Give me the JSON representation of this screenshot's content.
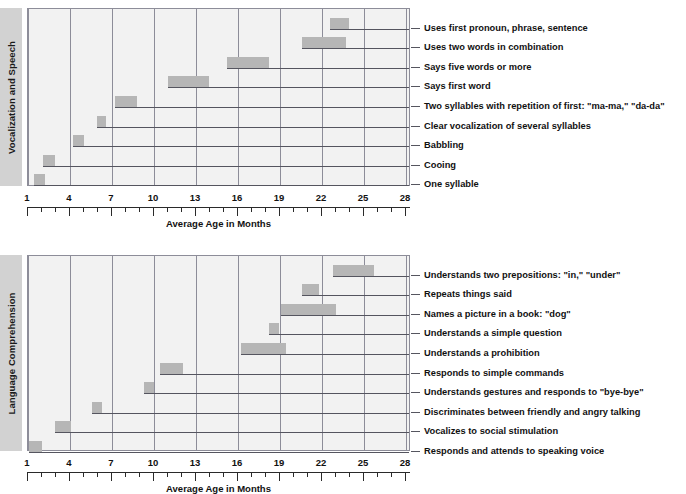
{
  "figure": {
    "axis_title": "Average Age in Months",
    "axis_ticks": [
      1,
      4,
      7,
      10,
      13,
      16,
      19,
      22,
      25,
      28
    ],
    "axis_min": 1,
    "axis_max": 28,
    "bar_color": "#b6b6b6",
    "plot_background": "#f2f2f2",
    "grid_color": "#8d8d99",
    "sidebar_background": "#d2d2d2"
  },
  "panels": [
    {
      "id": "vocal",
      "title": "Vocalization and Speech",
      "axis_title": "Average Age in Months",
      "rows": [
        {
          "label": "Uses first pronoun, phrase, sentence",
          "start": 22.6,
          "end": 23.9
        },
        {
          "label": "Uses two words in combination",
          "start": 20.6,
          "end": 23.7
        },
        {
          "label": "Says five words or more",
          "start": 15.2,
          "end": 18.2
        },
        {
          "label": "Says first word",
          "start": 11.0,
          "end": 13.9
        },
        {
          "label": "Two syllables with repetition of first: \"ma-ma,\" \"da-da\"",
          "start": 7.2,
          "end": 8.8
        },
        {
          "label": "Clear vocalization of several syllables",
          "start": 5.9,
          "end": 6.6
        },
        {
          "label": "Babbling",
          "start": 4.2,
          "end": 5.0
        },
        {
          "label": "Cooing",
          "start": 2.1,
          "end": 2.9
        },
        {
          "label": "One syllable",
          "start": 1.4,
          "end": 2.2
        }
      ]
    },
    {
      "id": "lang",
      "title": "Language Comprehension",
      "axis_title": "Average Age in Months",
      "rows": [
        {
          "label": "Understands two prepositions: \"in,\" \"under\"",
          "start": 22.8,
          "end": 25.7
        },
        {
          "label": "Repeats things said",
          "start": 20.6,
          "end": 21.8
        },
        {
          "label": "Names a picture in a book: \"dog\"",
          "start": 19.1,
          "end": 23.0
        },
        {
          "label": "Understands a simple question",
          "start": 18.2,
          "end": 18.9
        },
        {
          "label": "Understands a prohibition",
          "start": 16.2,
          "end": 19.4
        },
        {
          "label": "Responds to simple commands",
          "start": 10.4,
          "end": 12.1
        },
        {
          "label": "Understands gestures and responds to \"bye-bye\"",
          "start": 9.3,
          "end": 10.0
        },
        {
          "label": "Discriminates between friendly and angry talking",
          "start": 5.6,
          "end": 6.3
        },
        {
          "label": "Vocalizes to social stimulation",
          "start": 2.9,
          "end": 4.1
        },
        {
          "label": "Responds and attends to speaking voice",
          "start": 1.1,
          "end": 2.0
        }
      ]
    }
  ],
  "chart_data": {
    "type": "bar",
    "xlabel": "Average Age in Months",
    "ylabel": "",
    "xlim": [
      1,
      28
    ],
    "grid": true,
    "legend": "none",
    "orientation": "horizontal-range",
    "note": "Each row is a floating (range) bar spanning the typical age window for a milestone; a leader line runs from the bar to its label on the right.",
    "panels": [
      {
        "name": "Vocalization and Speech",
        "categories": [
          "Uses first pronoun, phrase, sentence",
          "Uses two words in combination",
          "Says five words or more",
          "Says first word",
          "Two syllables with repetition of first: \"ma-ma,\" \"da-da\"",
          "Clear vocalization of several syllables",
          "Babbling",
          "Cooing",
          "One syllable"
        ],
        "ranges": [
          [
            22.6,
            23.9
          ],
          [
            20.6,
            23.7
          ],
          [
            15.2,
            18.2
          ],
          [
            11.0,
            13.9
          ],
          [
            7.2,
            8.8
          ],
          [
            5.9,
            6.6
          ],
          [
            4.2,
            5.0
          ],
          [
            2.1,
            2.9
          ],
          [
            1.4,
            2.2
          ]
        ]
      },
      {
        "name": "Language Comprehension",
        "categories": [
          "Understands two prepositions: \"in,\" \"under\"",
          "Repeats things said",
          "Names a picture in a book: \"dog\"",
          "Understands a simple question",
          "Understands a prohibition",
          "Responds to simple commands",
          "Understands gestures and responds to \"bye-bye\"",
          "Discriminates between friendly and angry talking",
          "Vocalizes to social stimulation",
          "Responds and attends to speaking voice"
        ],
        "ranges": [
          [
            22.8,
            25.7
          ],
          [
            20.6,
            21.8
          ],
          [
            19.1,
            23.0
          ],
          [
            18.2,
            18.9
          ],
          [
            16.2,
            19.4
          ],
          [
            10.4,
            12.1
          ],
          [
            9.3,
            10.0
          ],
          [
            5.6,
            6.3
          ],
          [
            2.9,
            4.1
          ],
          [
            1.1,
            2.0
          ]
        ]
      }
    ]
  }
}
